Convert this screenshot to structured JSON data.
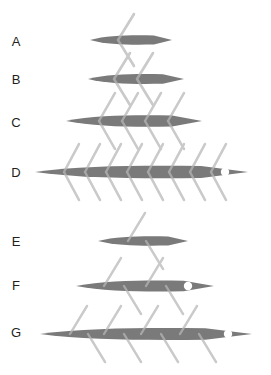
{
  "figure": {
    "title": "",
    "background_color": "#ffffff",
    "body_color": "#7a7a7a",
    "line_color": "#cacaca",
    "label_color": "#231f20",
    "marker_color": "#ffffff",
    "width": 271,
    "height": 375
  },
  "rows": [
    {
      "label": "A",
      "label_x": 16,
      "label_y": 46,
      "group": "chevron",
      "axis_y": 40,
      "body_left": 90,
      "body_right": 172,
      "body_half_height": 5.0,
      "chevron_count": 1,
      "chevron_xs": [
        118
      ],
      "chevron_arm_dx": 16,
      "chevron_arm_dy": 26,
      "has_marker": false,
      "marker_x": null,
      "marker_r": 0
    },
    {
      "label": "B",
      "label_x": 16,
      "label_y": 84,
      "group": "chevron",
      "axis_y": 79,
      "body_left": 88,
      "body_right": 184,
      "body_half_height": 5.2,
      "chevron_count": 2,
      "chevron_xs": [
        114,
        137
      ],
      "chevron_arm_dx": 16,
      "chevron_arm_dy": 26,
      "has_marker": false,
      "marker_x": null,
      "marker_r": 0
    },
    {
      "label": "C",
      "label_x": 16,
      "label_y": 127,
      "group": "chevron",
      "axis_y": 121,
      "body_left": 66,
      "body_right": 202,
      "body_half_height": 6.0,
      "chevron_count": 4,
      "chevron_xs": [
        99,
        122,
        145,
        168
      ],
      "chevron_arm_dx": 16,
      "chevron_arm_dy": 28,
      "has_marker": false,
      "marker_x": null,
      "marker_r": 0
    },
    {
      "label": "D",
      "label_x": 16,
      "label_y": 177,
      "group": "chevron",
      "axis_y": 172,
      "body_left": 35,
      "body_right": 248,
      "body_half_height": 6.5,
      "chevron_count": 8,
      "chevron_xs": [
        64,
        85,
        106,
        127,
        148,
        169,
        190,
        211
      ],
      "chevron_arm_dx": 15,
      "chevron_arm_dy": 28,
      "has_marker": true,
      "marker_x": 225,
      "marker_r": 4.2
    },
    {
      "label": "E",
      "label_x": 16,
      "label_y": 246,
      "group": "slash",
      "axis_y": 241,
      "body_left": 98,
      "body_right": 188,
      "body_half_height": 5.0,
      "slash_up_xs": [
        128
      ],
      "slash_down_xs": [
        146
      ],
      "slash_dx": 17,
      "slash_dy": 28,
      "has_marker": false,
      "marker_x": null,
      "marker_r": 0
    },
    {
      "label": "F",
      "label_x": 16,
      "label_y": 290,
      "group": "slash",
      "axis_y": 286,
      "body_left": 76,
      "body_right": 214,
      "body_half_height": 5.8,
      "slash_up_xs": [
        104,
        146
      ],
      "slash_down_xs": [
        124,
        166
      ],
      "slash_dx": 17,
      "slash_dy": 28,
      "has_marker": true,
      "marker_x": 188,
      "marker_r": 4.2
    },
    {
      "label": "G",
      "label_x": 16,
      "label_y": 337,
      "group": "slash",
      "axis_y": 334,
      "body_left": 40,
      "body_right": 252,
      "body_half_height": 6.2,
      "slash_up_xs": [
        70,
        104,
        141,
        180
      ],
      "slash_down_xs": [
        88,
        124,
        161,
        199
      ],
      "slash_dx": 17,
      "slash_dy": 28,
      "has_marker": true,
      "marker_x": 228,
      "marker_r": 4.2
    }
  ]
}
